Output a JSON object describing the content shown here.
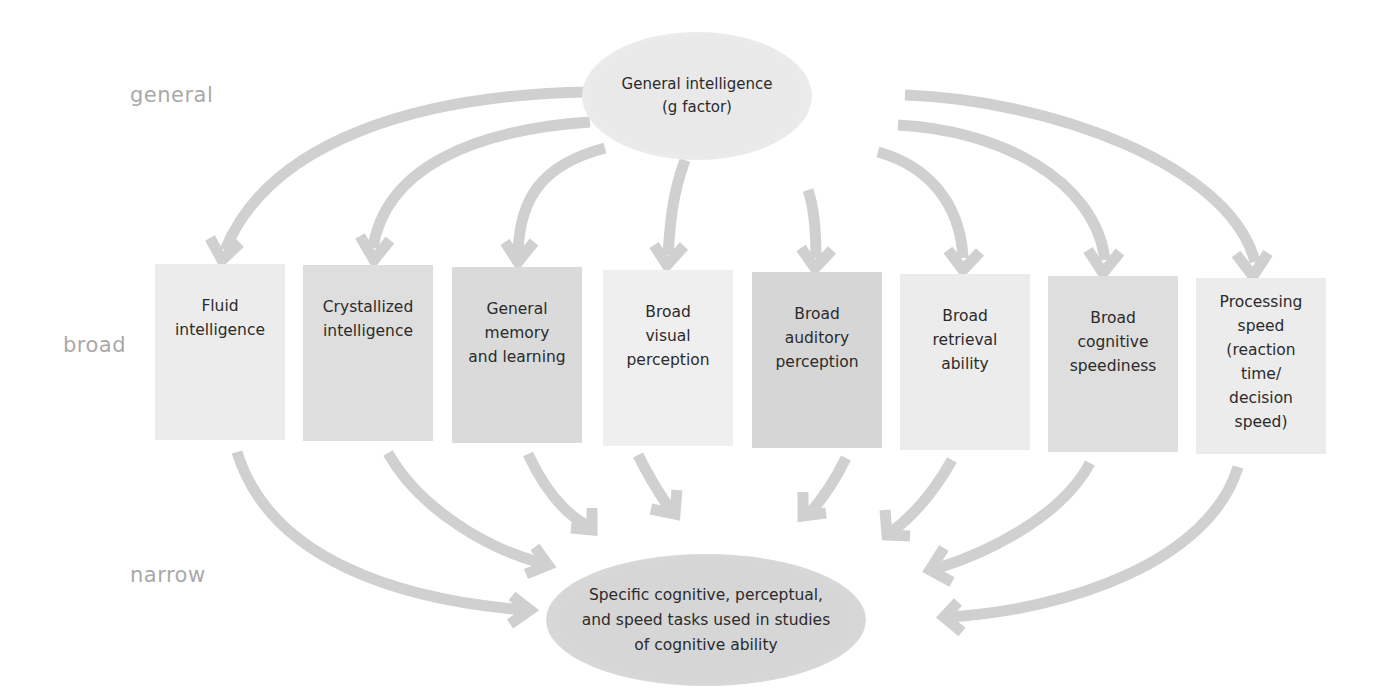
{
  "levels": {
    "general": "general",
    "broad": "broad",
    "narrow": "narrow"
  },
  "top_node": {
    "label": "General intelligence\n(g factor)"
  },
  "broad_abilities": [
    {
      "label": "Fluid\nintelligence",
      "shade": "#ececec"
    },
    {
      "label": "Crystallized\nintelligence",
      "shade": "#dedede"
    },
    {
      "label": "General\nmemory\nand learning",
      "shade": "#dadada"
    },
    {
      "label": "Broad\nvisual\nperception",
      "shade": "#efefef"
    },
    {
      "label": "Broad\nauditory\nperception",
      "shade": "#d6d6d6"
    },
    {
      "label": "Broad\nretrieval\nability",
      "shade": "#ececec"
    },
    {
      "label": "Broad\ncognitive\nspeediness",
      "shade": "#dedede"
    },
    {
      "label": "Processing\nspeed\n(reaction\ntime/\ndecision\nspeed)",
      "shade": "#ececec"
    }
  ],
  "bottom_node": {
    "label": "Specific cognitive, perceptual,\nand speed tasks used in studies\nof cognitive ability"
  },
  "colors": {
    "arrow": "#cfcfcf",
    "level_label": "#a9a9a9",
    "text": "#2b2b2b"
  }
}
